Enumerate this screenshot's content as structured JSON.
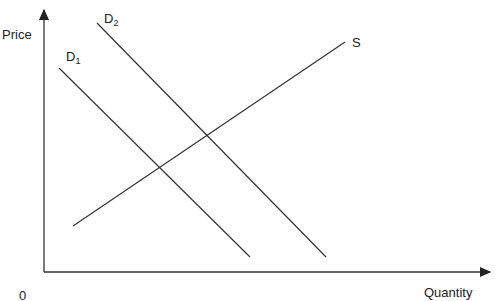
{
  "axes": {
    "y_label": "Price",
    "x_label": "Quantity",
    "origin_label": "0"
  },
  "curves": [
    {
      "name": "S",
      "label": "S",
      "from": [
        73,
        226
      ],
      "to": [
        345,
        42
      ]
    },
    {
      "name": "D1",
      "label": "D",
      "sub": "1",
      "from": [
        59,
        68
      ],
      "to": [
        250,
        257
      ]
    },
    {
      "name": "D2",
      "label": "D",
      "sub": "2",
      "from": [
        97,
        23
      ],
      "to": [
        326,
        257
      ]
    }
  ],
  "colors": {
    "line": "#333333"
  }
}
